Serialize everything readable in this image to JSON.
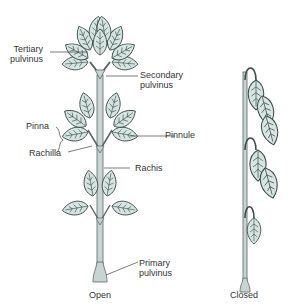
{
  "diagram": {
    "type": "botanical-illustration",
    "colors": {
      "leaf_fill": "#d6e4e2",
      "leaf_stroke": "#3c4a48",
      "stem_fill": "#c8d3d2",
      "stem_stroke": "#5a6665",
      "label_line": "#444444",
      "text": "#333333"
    },
    "labels": {
      "tertiary_pulvinus": "Tertiary\npulvinus",
      "secondary_pulvinus": "Secondary\npulvinus",
      "pinna": "Pinna",
      "pinnule": "Pinnule",
      "rachilla": "Rachilla",
      "rachis": "Rachis",
      "primary_pulvinus": "Primary\npulvinus"
    },
    "captions": {
      "open": "Open",
      "closed": "Closed"
    }
  }
}
